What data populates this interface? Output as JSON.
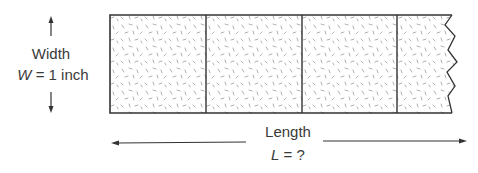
{
  "diagram": {
    "width_label": {
      "title": "Width",
      "symbol": "W",
      "equation_rest": " = 1 inch"
    },
    "length_label": {
      "title": "Length",
      "symbol": "L",
      "equation_rest": " = ?"
    },
    "strip": {
      "segments": 4,
      "fill": "speckled texture",
      "right_edge": "torn / zigzag"
    },
    "colors": {
      "stroke": "#333333",
      "speckle": "#9a9a9a",
      "text": "#3a3a3a"
    }
  }
}
